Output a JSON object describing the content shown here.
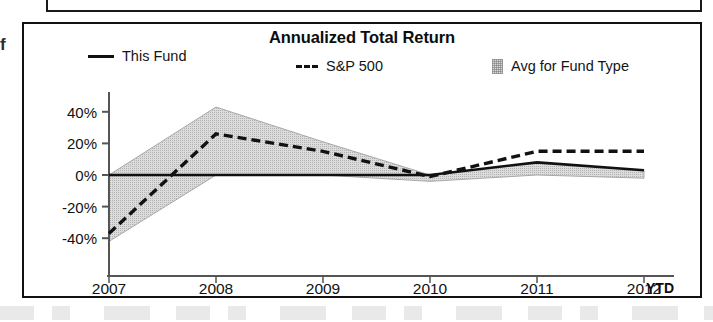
{
  "panel": {
    "title": "Annualized Total Return",
    "margin_glyph": "f"
  },
  "legend": {
    "items": [
      {
        "label": "This Fund",
        "marker": "solid-line-swatch"
      },
      {
        "label": "S&P 500",
        "marker": "dashed-line-swatch",
        "prefix": "---"
      },
      {
        "label": "Avg for Fund Type",
        "marker": "shaded-band-swatch"
      }
    ]
  },
  "axes": {
    "y_ticks": [
      "40%",
      "20%",
      "0%",
      "-20%",
      "-40%"
    ],
    "x_ticks": [
      "2007",
      "2008",
      "2009",
      "2010",
      "2011",
      "2012"
    ],
    "x_suffix": "YTD"
  },
  "colors": {
    "line": "#111111",
    "band_fill": "#dcdcdc",
    "band_edge": "#a8a8a8",
    "axis": "#555555",
    "panel_border": "#111111",
    "text": "#111111"
  },
  "chart_data": {
    "type": "line",
    "title": "Annualized Total Return",
    "xlabel": "",
    "ylabel": "",
    "x": [
      "2007",
      "2008",
      "2009",
      "2010",
      "2011",
      "2012"
    ],
    "x_note": "2012 value is year-to-date (YTD)",
    "ylim": [
      -50,
      50
    ],
    "ytick_values": [
      40,
      20,
      0,
      -20,
      -40
    ],
    "grid": false,
    "legend_position": "top",
    "series": [
      {
        "name": "This Fund",
        "style": "solid",
        "values": [
          0,
          0,
          0,
          0,
          8,
          3
        ]
      },
      {
        "name": "S&P 500",
        "style": "dashed",
        "values": [
          -37,
          26,
          15,
          -1,
          15,
          15
        ]
      },
      {
        "name": "Avg for Fund Type",
        "style": "shaded-band",
        "upper": [
          0,
          43,
          21,
          0,
          8,
          3
        ],
        "lower": [
          -42,
          0,
          0,
          -4,
          0,
          -2
        ]
      }
    ]
  }
}
